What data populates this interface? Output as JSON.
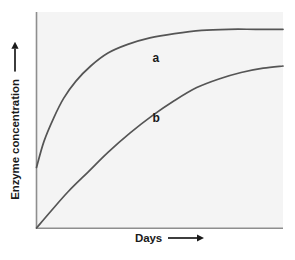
{
  "chart_data": {
    "type": "line",
    "title": "",
    "subtitle": "",
    "xlabel": "Days",
    "ylabel": "Enzyme concentration",
    "xlabel_arrow": "right-arrow",
    "ylabel_arrow": "up-arrow",
    "grid": false,
    "legend": "inline-curve-labels",
    "axes_shown": [
      "left",
      "bottom"
    ],
    "axis_ticks": [],
    "xtick_labels": [],
    "ytick_labels": [],
    "xlim": [
      0,
      100
    ],
    "ylim": [
      0,
      100
    ],
    "plot_bgcolor": "#f4f4f4",
    "figure_bgcolor": "#ffffff",
    "axis_color": "#8e8e8e",
    "curve_color": "#555555",
    "series": [
      {
        "name": "a",
        "label": "a",
        "label_x": 47,
        "label_y": 77,
        "description": "saturating curve starting above origin, rises steeply then plateaus high",
        "x": [
          0,
          3,
          7,
          11,
          16,
          22,
          29,
          37,
          46,
          56,
          67,
          78,
          89,
          100
        ],
        "y": [
          28,
          40,
          51,
          60,
          68,
          75,
          81,
          85,
          88,
          90,
          91.5,
          92,
          92,
          92
        ]
      },
      {
        "name": "b",
        "label": "b",
        "label_x": 47,
        "label_y": 49,
        "description": "saturating curve starting at origin, rises gradually then plateaus lower",
        "x": [
          0,
          6,
          13,
          21,
          29,
          38,
          47,
          56,
          65,
          74,
          83,
          92,
          100
        ],
        "y": [
          0,
          8,
          17,
          26,
          35,
          44,
          52,
          59,
          65,
          69,
          72,
          74,
          75
        ]
      }
    ]
  },
  "figure": {
    "ylabel": "Enzyme concentration",
    "xlabel": "Days",
    "curve_a_label": "a",
    "curve_b_label": "b"
  }
}
